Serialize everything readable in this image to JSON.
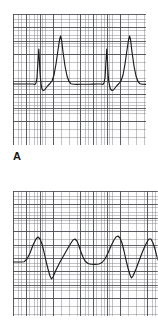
{
  "figure": {
    "title": "",
    "background_color": "#ffffff",
    "trace_color": "#1c1c1c",
    "grid_fine_color": "#6e6e76",
    "grid_major_color": "#484850"
  },
  "panels": [
    {
      "id": "panel-a",
      "label": "A",
      "description": "ECG rhythm strip with pacing spikes and tall peaked complexes",
      "grid": {
        "small_box_px": 2.68,
        "large_box_px": 13.4,
        "visible": true
      }
    },
    {
      "id": "panel-b",
      "label": "",
      "description": "ECG rhythm strip showing wide-complex tachycardia",
      "grid": {
        "small_box_px": 2.68,
        "large_box_px": 13.4,
        "visible": true
      }
    }
  ],
  "chart_data": [
    {
      "type": "line",
      "id": "panel-a-trace",
      "title": "A",
      "xlabel": "",
      "ylabel": "",
      "xlim": [
        0,
        133
      ],
      "ylim": [
        0,
        131
      ],
      "grid": true,
      "legend": "none",
      "baseline_y": 70,
      "annotations": [
        "pacing spike",
        "tall peaked complex"
      ],
      "series": [
        {
          "name": "ecg-a",
          "points": "M 0,70 L 20,70 L 22,70.5 L 23,69 L 24,64 L 25,47 L 25.8,35 L 26.4,46 L 27,58 L 27.6,66 L 28.2,71 L 29,75 L 30,76.5 L 31.5,76 L 33,74 L 35,71.5 L 37,69.5 L 39,67 L 41,61 L 43,50 L 45,36 L 46.5,26 L 47.6,22 L 48.6,26 L 50,38 L 52,52 L 54,62 L 56,67.5 L 58,69.8 L 60.5,70.3 L 64,70.4 L 68,70.3 L 72,70.2 L 76,70.2 L 80,70.1 L 84,70 L 88,70 L 90,70.4 L 91,69 L 92,64 L 93,47 L 93.8,35 L 94.4,46 L 95,58 L 95.6,66 L 96.4,71 L 97.4,75 L 99,76.5 L 100.5,76 L 102,74 L 104,71.5 L 106,69.5 L 108,67 L 110,61 L 112,50 L 114,36 L 115.5,26 L 116.6,22 L 117.6,26 L 119,38 L 121,52 L 123,62 L 125,67.5 L 127,69.8 L 129.5,70.3 L 133,70.4"
        }
      ]
    },
    {
      "type": "line",
      "id": "panel-b-trace",
      "title": "",
      "xlabel": "",
      "ylabel": "",
      "xlim": [
        0,
        145
      ],
      "ylim": [
        0,
        125
      ],
      "grid": true,
      "legend": "none",
      "baseline_y": 71,
      "annotations": [
        "wide complex",
        "deep negative deflection"
      ],
      "series": [
        {
          "name": "ecg-b",
          "points": "M 0,71 L 8,71 L 11,70.8 L 14,68 L 17,62 L 20,54 L 23,48 L 25,46 L 27,48 L 29,53 L 31,61 L 33,70 L 35,78 L 37,85 L 38.5,88 L 40,86 L 43,79 L 47,71 L 51,64 L 55,57 L 58,52 L 60,49 L 62,48 L 64,50 L 66,55 L 68,61 L 70,66 L 72,70 L 75,72.5 L 78,73.2 L 82,73.4 L 86,73 L 89,71.5 L 92,68 L 95,62 L 98,55 L 101,49 L 103,46 L 105,45 L 107,47 L 109,52 L 111,60 L 113,69 L 115,77 L 117,84 L 118.5,87 L 120,85 L 123,78 L 126,70 L 129,62 L 132,55 L 134,51 L 136,48 L 138,48 L 140,52 L 142,58 L 143.5,64 L 145,69"
        }
      ]
    }
  ]
}
